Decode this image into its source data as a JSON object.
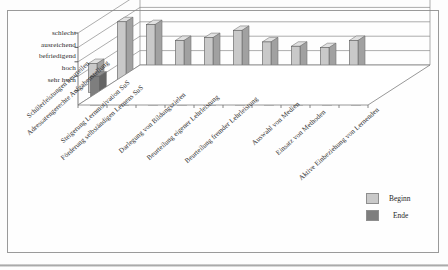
{
  "chart_data": {
    "type": "bar",
    "title": "",
    "subtitle": "",
    "xlabel": "",
    "ylabel": "",
    "grid": true,
    "legend_position": "bottom-right",
    "y_axis_kind": "ordinal-inverted",
    "ytick_labels": [
      "schlecht",
      "ausreichend",
      "befriedigend",
      "hoch",
      "sehr hoch"
    ],
    "y_levels_best_to_worst": [
      "sehr hoch",
      "hoch",
      "befriedigend",
      "ausreichend",
      "schlecht"
    ],
    "ylim": [
      0,
      5
    ],
    "categories": [
      "Schülerleistungen beurteilen",
      "Adressatengerechte Aufgabenstellung",
      "Steigerung Lernmotivation SuS",
      "Förderung selbständigen Lernens SuS",
      "Darlegung von Bildungszielen",
      "Beurteilung eigener Lehrleistung",
      "Beurteilung fremder Lehrleistung",
      "Auswahl von Medien",
      "Einsatz von Methoden",
      "Aktive Einbeziehung von Lernenden"
    ],
    "series": [
      {
        "name": "Beginn",
        "color": "#c9c9c9",
        "values": [
          2.0,
          4.9,
          4.7,
          3.6,
          3.8,
          4.3,
          3.5,
          3.2,
          3.1,
          3.6
        ]
      },
      {
        "name": "Ende",
        "color": "#7e7e7e",
        "values": [
          2.0,
          1.8,
          1.9,
          1.7,
          1.8,
          1.3,
          1.2,
          0.9,
          0.9,
          1.7
        ]
      }
    ]
  },
  "legend": {
    "entries": [
      {
        "label": "Beginn",
        "color": "#c9c9c9"
      },
      {
        "label": "Ende",
        "color": "#7e7e7e"
      }
    ]
  },
  "axis": {
    "ytick_0": "schlecht",
    "ytick_1": "ausreichend",
    "ytick_2": "befriedigend",
    "ytick_3": "hoch",
    "ytick_4": "sehr hoch"
  },
  "cats": {
    "c0": "Schülerleistungen beurteilen",
    "c1": "Adressatengerechte Aufgabenstellung",
    "c2": "Steigerung Lernmotivation SuS",
    "c3": "Förderung selbständigen Lernens SuS",
    "c4": "Darlegung von Bildungszielen",
    "c5": "Beurteilung eigener Lehrleistung",
    "c6": "Beurteilung fremder Lehrleistung",
    "c7": "Auswahl von Medien",
    "c8": "Einsatz von Methoden",
    "c9": "Aktive Einbeziehung von Lernenden"
  }
}
